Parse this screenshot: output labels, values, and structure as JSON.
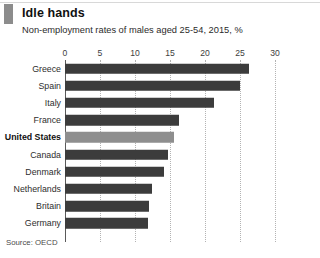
{
  "header": {
    "title": "Idle hands",
    "subtitle": "Non-employment rates of males aged 25-54, 2015, %",
    "brand_tag_color": "#8c8c8c"
  },
  "footer": {
    "source": "Source: OECD"
  },
  "colors": {
    "bar": "#3c3c3c",
    "bar_highlight": "#8e8e8e",
    "gridline": "#b3b3b3",
    "axis": "#5a5a5a"
  },
  "chart_data": {
    "type": "bar",
    "orientation": "horizontal",
    "title": "Idle hands",
    "subtitle": "Non-employment rates of males aged 25-54, 2015, %",
    "xlabel": "",
    "ylabel": "",
    "xlim": [
      0,
      30
    ],
    "xticks": [
      0,
      5,
      10,
      15,
      20,
      25,
      30
    ],
    "xtick_labels": [
      "0",
      "5",
      "10",
      "15",
      "20",
      "25",
      "30"
    ],
    "grid": true,
    "legend": false,
    "source": "Source: OECD",
    "highlight_category": "United States",
    "categories": [
      "Greece",
      "Spain",
      "Italy",
      "France",
      "United States",
      "Canada",
      "Denmark",
      "Netherlands",
      "Britain",
      "Germany"
    ],
    "values": [
      26.3,
      25.0,
      21.3,
      16.3,
      15.5,
      14.7,
      14.2,
      12.4,
      12.0,
      11.9
    ],
    "bars": [
      {
        "label": "Greece",
        "value": 26.3,
        "highlight": false
      },
      {
        "label": "Spain",
        "value": 25.0,
        "highlight": false
      },
      {
        "label": "Italy",
        "value": 21.3,
        "highlight": false
      },
      {
        "label": "France",
        "value": 16.3,
        "highlight": false
      },
      {
        "label": "United States",
        "value": 15.5,
        "highlight": true
      },
      {
        "label": "Canada",
        "value": 14.7,
        "highlight": false
      },
      {
        "label": "Denmark",
        "value": 14.2,
        "highlight": false
      },
      {
        "label": "Netherlands",
        "value": 12.4,
        "highlight": false
      },
      {
        "label": "Britain",
        "value": 12.0,
        "highlight": false
      },
      {
        "label": "Germany",
        "value": 11.9,
        "highlight": false
      }
    ]
  }
}
